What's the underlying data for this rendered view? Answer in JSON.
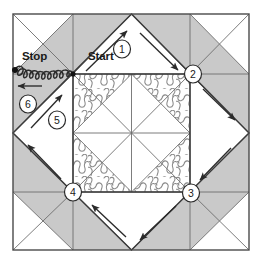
{
  "diagram": {
    "block": {
      "name": "pieced-quilt-block",
      "grid": "3x3",
      "outer_x": 13,
      "outer_y": 14,
      "outer_size": 236,
      "center_x": 73,
      "center_y": 74,
      "center_size": 118
    },
    "colors": {
      "shaded_fabric": "#c9c9c9",
      "plain_fabric": "#ffffff",
      "line": "#4a4a4a",
      "heavy_line": "#3a3a3a",
      "stipple": "#808080",
      "arrow": "#2a2a2a",
      "text": "#1a1a1a",
      "background": "#ffffff"
    },
    "labels": [
      {
        "id": "start",
        "text": "Start",
        "x": 88,
        "y": 57
      },
      {
        "id": "stop",
        "text": "Stop",
        "x": 22,
        "y": 57
      }
    ],
    "step_markers": [
      {
        "id": "step-1",
        "text": "1",
        "cx": 122,
        "cy": 49
      },
      {
        "id": "step-2",
        "text": "2",
        "cx": 193,
        "cy": 74
      },
      {
        "id": "step-3",
        "text": "3",
        "cx": 191,
        "cy": 193
      },
      {
        "id": "step-4",
        "text": "4",
        "cx": 73,
        "cy": 192
      },
      {
        "id": "step-5",
        "text": "5",
        "cx": 57,
        "cy": 120
      },
      {
        "id": "step-6",
        "text": "6",
        "cx": 28,
        "cy": 104
      }
    ],
    "path_arrows": [
      {
        "id": "arrow-1-up-right",
        "x1": 86,
        "y1": 71,
        "x2": 127,
        "y2": 31
      },
      {
        "id": "arrow-1-down-right",
        "x1": 140,
        "y1": 33,
        "x2": 178,
        "y2": 70
      },
      {
        "id": "arrow-2-down-right",
        "x1": 203,
        "y1": 89,
        "x2": 235,
        "y2": 120
      },
      {
        "id": "arrow-3-down-left",
        "x1": 231,
        "y1": 148,
        "x2": 200,
        "y2": 180
      },
      {
        "id": "arrow-3-down-left-2",
        "x1": 176,
        "y1": 206,
        "x2": 140,
        "y2": 240
      },
      {
        "id": "arrow-4-up-left",
        "x1": 126,
        "y1": 237,
        "x2": 92,
        "y2": 205
      },
      {
        "id": "arrow-5-up-left",
        "x1": 61,
        "y1": 179,
        "x2": 28,
        "y2": 145
      },
      {
        "id": "arrow-5-up-right",
        "x1": 31,
        "y1": 128,
        "x2": 62,
        "y2": 95
      },
      {
        "id": "arrow-6-left",
        "x1": 42,
        "y1": 86,
        "x2": 18,
        "y2": 86
      }
    ],
    "stipple_note": "meandering stipple quilting texture",
    "start_dot": {
      "id": "start-node",
      "cx": 73,
      "cy": 74,
      "r": 2.6
    },
    "stop_dot": {
      "id": "stop-node",
      "cx": 15,
      "cy": 70,
      "r": 3.0
    }
  }
}
